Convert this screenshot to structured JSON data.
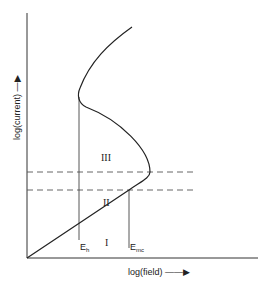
{
  "diagram": {
    "axes": {
      "x_label": "log(field)",
      "y_label": "log(current)"
    },
    "regions": [
      {
        "id": "I",
        "label": "I"
      },
      {
        "id": "II",
        "label": "II"
      },
      {
        "id": "III",
        "label": "III"
      }
    ],
    "markers": [
      {
        "id": "Eh",
        "base": "E",
        "sub": "h"
      },
      {
        "id": "Emc",
        "base": "E",
        "sub": "mc"
      }
    ],
    "colors": {
      "line": "#222222",
      "dashed": "#555555",
      "background": "#ffffff"
    }
  }
}
